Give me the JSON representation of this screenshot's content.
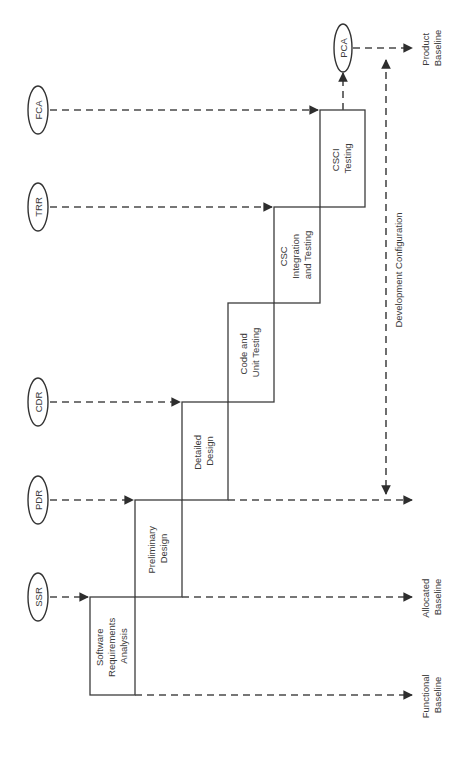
{
  "diagram": {
    "type": "software-development-waterfall-staircase",
    "orientation": "rotated-90-ccw",
    "colors": {
      "line": "#3c3c3c",
      "dash": "#4a4a4a",
      "text": "#3a3a3a",
      "background": "#ffffff"
    },
    "phases": [
      {
        "id": "sra",
        "lines": [
          "Software",
          "Requirements",
          "Analysis"
        ]
      },
      {
        "id": "pd",
        "lines": [
          "Preliminary",
          "Design"
        ]
      },
      {
        "id": "dd",
        "lines": [
          "Detailed",
          "Design"
        ]
      },
      {
        "id": "cut",
        "lines": [
          "Code and",
          "Unit Testing"
        ]
      },
      {
        "id": "cscit",
        "lines": [
          "CSC",
          "Integration",
          "and Testing"
        ]
      },
      {
        "id": "csci",
        "lines": [
          "CSCI",
          "Testing"
        ]
      }
    ],
    "reviews": [
      {
        "id": "ssr",
        "label": "SSR"
      },
      {
        "id": "pdr",
        "label": "PDR"
      },
      {
        "id": "cdr",
        "label": "CDR"
      },
      {
        "id": "trr",
        "label": "TRR"
      },
      {
        "id": "fca",
        "label": "FCA"
      },
      {
        "id": "pca",
        "label": "PCA"
      }
    ],
    "baselines": {
      "functional": [
        "Functional",
        "Baseline"
      ],
      "allocated": [
        "Allocated",
        "Baseline"
      ],
      "product": [
        "Product",
        "Baseline"
      ],
      "development_configuration": "Development Configuration"
    }
  }
}
